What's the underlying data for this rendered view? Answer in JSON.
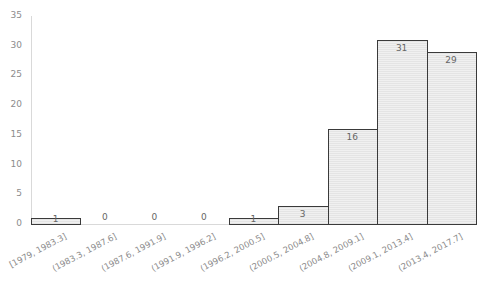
{
  "chart_data": {
    "type": "bar",
    "title": "",
    "xlabel": "",
    "ylabel": "",
    "ylim": [
      0,
      35
    ],
    "yticks": [
      0,
      5,
      10,
      15,
      20,
      25,
      30,
      35
    ],
    "grid": false,
    "legend": null,
    "categories": [
      "[1979, 1983.3]",
      "(1983.3, 1987.6]",
      "(1987.6, 1991.9]",
      "(1991.9, 1996.2]",
      "(1996.2, 2000.5]",
      "(2000.5, 2004.8]",
      "(2004.8, 2009.1]",
      "(2009.1, 2013.4]",
      "(2013.4, 2017.7]"
    ],
    "values": [
      1,
      0,
      0,
      0,
      1,
      3,
      16,
      31,
      29
    ],
    "data_labels": [
      "1",
      "0",
      "0",
      "0",
      "1",
      "3",
      "16",
      "31",
      "29"
    ]
  },
  "colors": {
    "bar_fill": "#ebebeb",
    "bar_border": "#3a3a3a",
    "axis": "#d9d9d9",
    "tick_text": "#8c8c8c",
    "label_text": "#666666"
  }
}
